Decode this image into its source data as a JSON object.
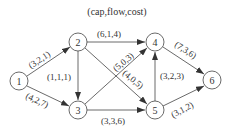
{
  "title": "(cap,flow,cost)",
  "nodes": [
    {
      "id": "1",
      "x": 19,
      "y": 81
    },
    {
      "id": "2",
      "x": 78,
      "y": 42
    },
    {
      "id": "3",
      "x": 78,
      "y": 110
    },
    {
      "id": "4",
      "x": 155,
      "y": 42
    },
    {
      "id": "5",
      "x": 155,
      "y": 110
    },
    {
      "id": "6",
      "x": 212,
      "y": 80
    }
  ],
  "edges": [
    {
      "from": "1",
      "to": "2",
      "label": "(3,2,1)"
    },
    {
      "from": "1",
      "to": "3",
      "label": "(4,2,7)"
    },
    {
      "from": "2",
      "to": "3",
      "label": "(1,1,1)"
    },
    {
      "from": "2",
      "to": "4",
      "label": "(6,1,4)"
    },
    {
      "from": "2",
      "to": "5",
      "label": "(4,0,5)"
    },
    {
      "from": "3",
      "to": "4",
      "label": "(5,0,3)"
    },
    {
      "from": "3",
      "to": "5",
      "label": "(3,3,6)"
    },
    {
      "from": "5",
      "to": "4",
      "label": "(3,2,3)"
    },
    {
      "from": "4",
      "to": "6",
      "label": "(7,3,6)"
    },
    {
      "from": "5",
      "to": "6",
      "label": "(3,1,2)"
    }
  ]
}
